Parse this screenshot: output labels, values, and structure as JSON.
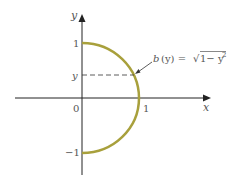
{
  "diagram": {
    "axes": {
      "x_label": "x",
      "y_label": "y",
      "origin_label": "0",
      "x_tick_one": "1",
      "y_tick_one": "1",
      "y_tick_neg_one": "−1",
      "y_tick_var": "y"
    },
    "curve": {
      "description": "right half of unit circle",
      "color": "#a8a03c"
    },
    "annotation": {
      "b_label": "b",
      "arg_label": "(y) = ",
      "sqrt_body": "1− y",
      "exponent": "2"
    }
  }
}
